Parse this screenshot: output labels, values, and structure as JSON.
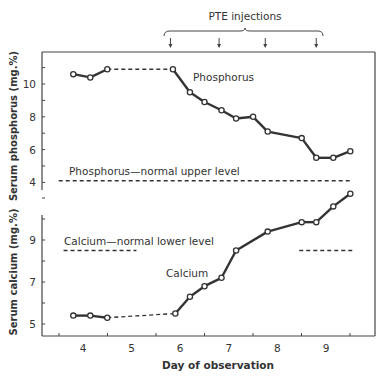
{
  "chart_data": {
    "type": "line",
    "title": "",
    "annotation_top": "PTE injections",
    "injection_days": [
      5.8,
      6.8,
      7.75,
      8.8
    ],
    "xlabel": "Day of observation",
    "x_ticks": [
      4,
      5,
      6,
      7,
      8,
      9
    ],
    "xlim": [
      3.5,
      9.7
    ],
    "panels": [
      {
        "name": "phosphorus",
        "ylabel": "Serum phosphorus (mg.%)",
        "y_ticks": [
          4,
          6,
          8,
          10
        ],
        "ylim": [
          3.8,
          12
        ],
        "series": [
          {
            "name": "Phosphorus",
            "x": [
              3.8,
              4.15,
              4.5,
              5.85,
              6.2,
              6.5,
              6.85,
              7.15,
              7.5,
              7.8,
              8.5,
              8.8,
              9.15,
              9.5
            ],
            "y": [
              10.6,
              10.4,
              10.9,
              10.9,
              9.5,
              8.9,
              8.4,
              7.9,
              8.0,
              7.1,
              6.7,
              5.5,
              5.5,
              5.9
            ],
            "dashed_segment": [
              2,
              3
            ]
          }
        ],
        "reference_lines": [
          {
            "label": "Phosphorus—normal upper level",
            "y": 4.1,
            "x_from": 3.5,
            "x_to": 9.5
          }
        ]
      },
      {
        "name": "calcium",
        "ylabel": "Serum calcium (mg.%)",
        "y_ticks": [
          5,
          7,
          9
        ],
        "ylim": [
          4.5,
          11.5
        ],
        "series": [
          {
            "name": "Calcium",
            "x": [
              3.8,
              4.15,
              4.5,
              5.9,
              6.2,
              6.5,
              6.85,
              7.15,
              7.8,
              8.5,
              8.8,
              9.15,
              9.5
            ],
            "y": [
              5.4,
              5.4,
              5.3,
              5.5,
              6.3,
              6.8,
              7.2,
              8.5,
              9.4,
              9.85,
              9.85,
              10.6,
              11.2
            ],
            "dashed_segment": [
              2,
              3
            ]
          }
        ],
        "reference_lines": [
          {
            "label": "Calcium—normal lower level",
            "y": 8.5,
            "x_from": 3.6,
            "x_to": 5.1
          },
          {
            "label": "",
            "y": 8.5,
            "x_from": 8.45,
            "x_to": 9.55
          }
        ]
      }
    ],
    "grid": false,
    "legend": "inline labels"
  },
  "labels": {
    "pte": "PTE injections",
    "xlabel": "Day of observation",
    "ylabel_p": "Serum phosphorus (mg.%)",
    "ylabel_c": "Serum calcium (mg.%)",
    "series_p": "Phosphorus",
    "series_c": "Calcium",
    "ref_p": "Phosphorus—normal upper level",
    "ref_c": "Calcium—normal lower level"
  }
}
